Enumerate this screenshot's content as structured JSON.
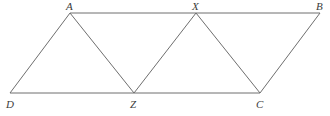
{
  "figure": {
    "kind": "geometry-diagram",
    "background_color": "#ffffff",
    "stroke_color": "#6e6e6e",
    "label_color": "#3c3c3c",
    "stroke_width": 1,
    "width": 330,
    "height": 116
  },
  "points": {
    "A": {
      "label": "A",
      "x": 70,
      "y": 13,
      "label_x": 66,
      "label_y": 1
    },
    "B": {
      "label": "B",
      "x": 320,
      "y": 13,
      "label_x": 316,
      "label_y": 1
    },
    "C": {
      "label": "C",
      "x": 260,
      "y": 93,
      "label_x": 256,
      "label_y": 99
    },
    "D": {
      "label": "D",
      "x": 10,
      "y": 93,
      "label_x": 6,
      "label_y": 99
    },
    "X": {
      "label": "X",
      "x": 196,
      "y": 13,
      "label_x": 192,
      "label_y": 1
    },
    "Z": {
      "label": "Z",
      "x": 134,
      "y": 93,
      "label_x": 130,
      "label_y": 99
    }
  },
  "segments": [
    {
      "name": "segment-A-B",
      "from": "A",
      "to": "B",
      "x1": 70,
      "y1": 13,
      "x2": 320,
      "y2": 13
    },
    {
      "name": "segment-D-C",
      "from": "D",
      "to": "C",
      "x1": 10,
      "y1": 93,
      "x2": 260,
      "y2": 93
    },
    {
      "name": "segment-D-A",
      "from": "D",
      "to": "A",
      "x1": 10,
      "y1": 93,
      "x2": 70,
      "y2": 13
    },
    {
      "name": "segment-A-Z",
      "from": "A",
      "to": "Z",
      "x1": 70,
      "y1": 13,
      "x2": 134,
      "y2": 93
    },
    {
      "name": "segment-Z-X",
      "from": "Z",
      "to": "X",
      "x1": 134,
      "y1": 93,
      "x2": 196,
      "y2": 13
    },
    {
      "name": "segment-X-C",
      "from": "X",
      "to": "C",
      "x1": 196,
      "y1": 13,
      "x2": 260,
      "y2": 93
    },
    {
      "name": "segment-C-B",
      "from": "C",
      "to": "B",
      "x1": 260,
      "y1": 93,
      "x2": 320,
      "y2": 13
    }
  ]
}
